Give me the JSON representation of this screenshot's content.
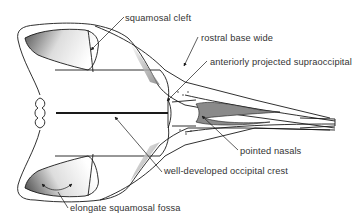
{
  "figure": {
    "line_color": "#1a1a1a",
    "shade_color": "#888888",
    "labels": [
      {
        "id": "squamosal-cleft",
        "text": "squamosal cleft",
        "x": 125,
        "y": 13
      },
      {
        "id": "rostral-base-wide",
        "text": "rostral base wide",
        "x": 201,
        "y": 33
      },
      {
        "id": "anteriorly-projected-supraoccipital",
        "text": "anteriorly projected supraoccipital",
        "x": 210,
        "y": 57
      },
      {
        "id": "pointed-nasals",
        "text": "pointed nasals",
        "x": 240,
        "y": 150
      },
      {
        "id": "well-developed-occipital-crest",
        "text": "well-developed occipital crest",
        "x": 164,
        "y": 168
      },
      {
        "id": "elongate-squamosal-fossa",
        "text": "elongate squamosal fossa",
        "x": 70,
        "y": 206
      }
    ]
  }
}
